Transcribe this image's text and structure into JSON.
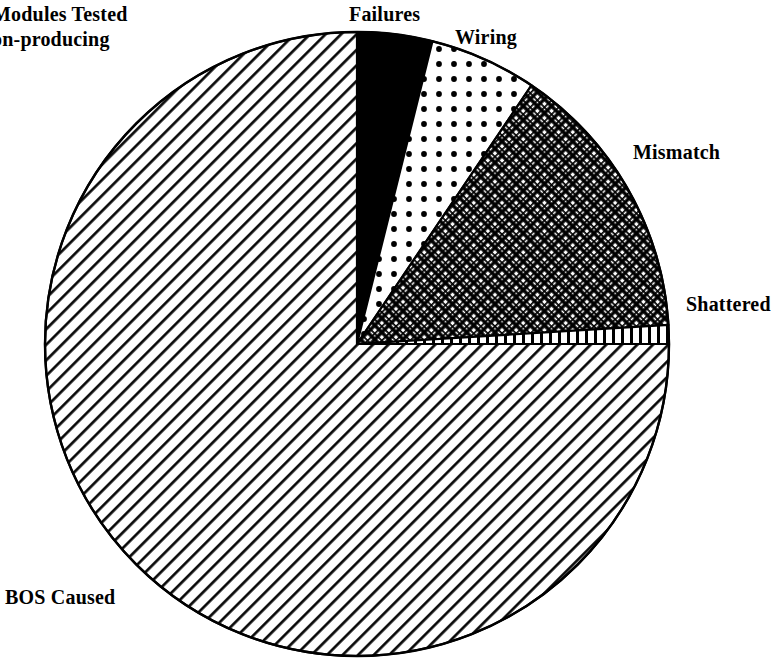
{
  "chart_data": {
    "type": "pie",
    "xlabel": "",
    "ylabel": "",
    "legend_position": "none",
    "grid": false,
    "center": {
      "x": 357,
      "y": 344
    },
    "radius": 312,
    "start_angle_deg": 90,
    "direction": "clockwise",
    "categories": [
      "Failures",
      "Wiring",
      "Mismatch",
      "Shattered",
      "BOS Caused"
    ],
    "values": [
      3.9,
      5.6,
      14.6,
      1.0,
      74.9
    ],
    "angles_deg": [
      14.0,
      20.0,
      52.5,
      3.5,
      270.0
    ],
    "slices": [
      {
        "label": "Failures",
        "value": 3.9,
        "angle_deg": 14.0,
        "pattern": "solid-black",
        "fill": "#000000"
      },
      {
        "label": "Wiring",
        "value": 5.6,
        "angle_deg": 20.0,
        "pattern": "dots",
        "fill": "#ffffff"
      },
      {
        "label": "Mismatch",
        "value": 14.6,
        "angle_deg": 52.5,
        "pattern": "crosshatch",
        "fill": "#ffffff"
      },
      {
        "label": "Shattered",
        "value": 1.0,
        "angle_deg": 3.5,
        "pattern": "vertical-stripes",
        "fill": "#ffffff"
      },
      {
        "label": "BOS Caused",
        "value": 74.9,
        "angle_deg": 270.0,
        "pattern": "diagonal-hatch",
        "fill": "#ffffff"
      }
    ],
    "colors": {
      "outline": "#000000",
      "background": "#ffffff",
      "ink": "#000000"
    }
  },
  "labels": {
    "title_line1": "Modules Tested",
    "title_line2": "on-producing",
    "failures": "Failures",
    "wiring": "Wiring",
    "mismatch": "Mismatch",
    "shattered": "Shattered",
    "bos_caused": "BOS Caused"
  }
}
